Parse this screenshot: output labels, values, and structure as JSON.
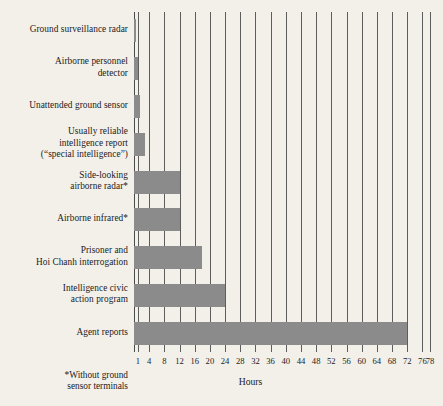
{
  "chart_data": {
    "type": "bar",
    "orientation": "horizontal",
    "title": "",
    "xlabel": "Hours",
    "ylabel": "",
    "xlim": [
      0,
      78
    ],
    "grid": true,
    "legend": false,
    "categories": [
      "Ground surveillance radar",
      "Airborne personnel detector",
      "Unattended ground sensor",
      "Usually reliable intelligence report (“special intelligence”)",
      "Side-looking airborne radar*",
      "Airborne infrared*",
      "Prisoner and Hoi Chanh interrogation",
      "Intelligence civic action program",
      "Agent reports"
    ],
    "values": [
      0.5,
      1,
      1.5,
      3,
      12,
      12,
      18,
      24,
      72
    ],
    "xticks": [
      1,
      4,
      8,
      12,
      16,
      20,
      24,
      28,
      32,
      36,
      40,
      44,
      48,
      52,
      56,
      60,
      64,
      68,
      72,
      76,
      78
    ],
    "xtick_labels": [
      "1",
      "4",
      "8",
      "12",
      "16",
      "20",
      "24",
      "28",
      "32",
      "36",
      "40",
      "44",
      "48",
      "52",
      "56",
      "60",
      "64",
      "68",
      "72",
      "76",
      "78"
    ],
    "annotations": [
      "*Without ground sensor terminals"
    ],
    "colors": {
      "bar_fill": "#8b8b8b",
      "background": "#f3f0ea",
      "gridline": "#5d5d5d",
      "text": "#1b1b1b"
    }
  },
  "labels": {
    "rows": [
      {
        "lines": [
          "Ground surveillance radar"
        ]
      },
      {
        "lines": [
          "Airborne personnel",
          "detector"
        ]
      },
      {
        "lines": [
          "Unattended ground sensor"
        ]
      },
      {
        "lines": [
          "Usually reliable",
          "intelligence report",
          "(“special intelligence”)"
        ]
      },
      {
        "lines": [
          "Side-looking",
          "airborne radar*"
        ]
      },
      {
        "lines": [
          "Airborne infrared*"
        ]
      },
      {
        "lines": [
          "Prisoner and",
          "Hoi Chanh interrogation"
        ]
      },
      {
        "lines": [
          "Intelligence civic",
          "action program"
        ]
      },
      {
        "lines": [
          "Agent reports"
        ]
      }
    ]
  },
  "axis": {
    "x_title": "Hours"
  },
  "footnote": {
    "line1": "*Without ground",
    "line2": "sensor terminals"
  }
}
